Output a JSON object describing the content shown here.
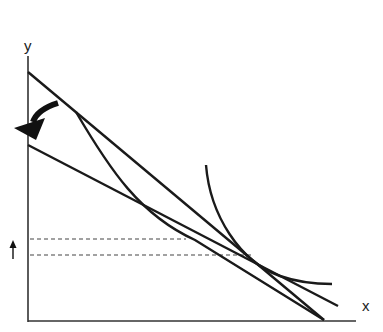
{
  "diagram": {
    "axes": {
      "x_label": "x",
      "y_label": "y"
    },
    "colors": {
      "line": "#1a1a1a",
      "axis": "#333333",
      "dashed": "#444444",
      "background": "#ffffff"
    },
    "elements": [
      {
        "id": "budget-line-original",
        "type": "line",
        "from": [
          28,
          72
        ],
        "to": [
          324,
          320
        ]
      },
      {
        "id": "budget-line-rotated",
        "type": "line",
        "from": [
          28,
          145
        ],
        "to": [
          338,
          306
        ]
      },
      {
        "id": "kinked-budget-curve",
        "type": "curve",
        "from": [
          76,
          112
        ],
        "to": [
          324,
          320
        ]
      },
      {
        "id": "indifference-curve",
        "type": "curve",
        "from": [
          206,
          165
        ],
        "to": [
          332,
          284
        ]
      },
      {
        "id": "dashed-level-upper",
        "type": "dashed-line",
        "y": 239,
        "from_x": 30,
        "to_x": 185
      },
      {
        "id": "dashed-level-lower",
        "type": "dashed-line",
        "y": 255,
        "from_x": 30,
        "to_x": 250
      },
      {
        "id": "rotation-arrow",
        "type": "arrow",
        "direction": "down-left"
      },
      {
        "id": "increase-arrow",
        "type": "arrow",
        "direction": "up"
      }
    ]
  }
}
